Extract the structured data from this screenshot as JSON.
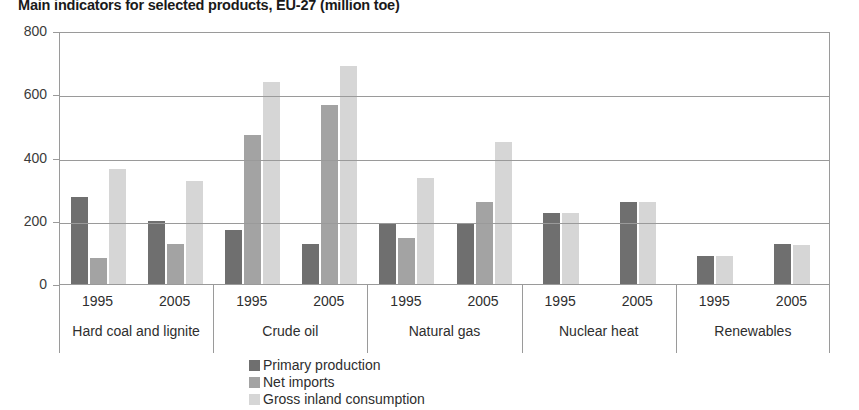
{
  "chart_data": {
    "type": "bar",
    "title": "Main indicators for selected products, EU-27 (million toe)",
    "xlabel": "",
    "ylabel": "",
    "ylim": [
      0,
      800
    ],
    "yticks": [
      0,
      200,
      400,
      600,
      800
    ],
    "ytick_labels": [
      "0",
      "200",
      "400",
      "600",
      "800"
    ],
    "grid": true,
    "legend_position": "bottom-center",
    "unit": "million toe",
    "series": [
      {
        "name": "Primary production",
        "color": "#6f6f6f",
        "values": [
          275,
          198,
          170,
          128,
          190,
          190,
          225,
          260,
          88,
          125
        ]
      },
      {
        "name": "Net imports",
        "color": "#a3a3a3",
        "values": [
          82,
          128,
          470,
          565,
          145,
          258,
          null,
          null,
          null,
          null
        ]
      },
      {
        "name": "Gross inland consumption",
        "color": "#d6d6d6",
        "values": [
          365,
          325,
          640,
          690,
          335,
          450,
          225,
          258,
          88,
          122
        ]
      }
    ],
    "categories": [
      {
        "group": "Hard coal and lignite",
        "year": "1995"
      },
      {
        "group": "Hard coal and lignite",
        "year": "2005"
      },
      {
        "group": "Crude oil",
        "year": "1995"
      },
      {
        "group": "Crude oil",
        "year": "2005"
      },
      {
        "group": "Natural gas",
        "year": "1995"
      },
      {
        "group": "Natural gas",
        "year": "2005"
      },
      {
        "group": "Nuclear heat",
        "year": "1995"
      },
      {
        "group": "Nuclear heat",
        "year": "2005"
      },
      {
        "group": "Renewables",
        "year": "1995"
      },
      {
        "group": "Renewables",
        "year": "2005"
      }
    ],
    "groups": [
      {
        "label": "Hard coal and lignite",
        "years": [
          "1995",
          "2005"
        ]
      },
      {
        "label": "Crude oil",
        "years": [
          "1995",
          "2005"
        ]
      },
      {
        "label": "Natural gas",
        "years": [
          "1995",
          "2005"
        ]
      },
      {
        "label": "Nuclear heat",
        "years": [
          "1995",
          "2005"
        ]
      },
      {
        "label": "Renewables",
        "years": [
          "1995",
          "2005"
        ]
      }
    ]
  },
  "colors": {
    "primary_production": "#6f6f6f",
    "net_imports": "#a3a3a3",
    "gross_inland_consumption": "#d6d6d6",
    "axis": "#9a9a9a",
    "text": "#2e2e2e"
  }
}
